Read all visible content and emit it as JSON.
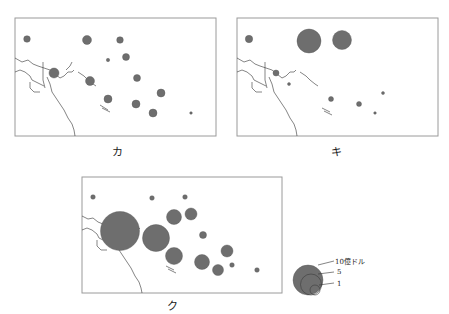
{
  "header": {
    "corner_text": ""
  },
  "maps": [
    {
      "id": "ka",
      "label": "カ",
      "frame": {
        "x": 15,
        "y": 18,
        "w": 201,
        "h": 118
      },
      "label_pos": {
        "x": 117,
        "y": 156
      },
      "bubbles": [
        {
          "cx": 27,
          "cy": 39,
          "r": 3.3
        },
        {
          "cx": 87,
          "cy": 40,
          "r": 4.5
        },
        {
          "cx": 120,
          "cy": 40,
          "r": 3.3
        },
        {
          "cx": 126,
          "cy": 57,
          "r": 3.5
        },
        {
          "cx": 108,
          "cy": 60,
          "r": 1.7
        },
        {
          "cx": 54,
          "cy": 73,
          "r": 5
        },
        {
          "cx": 90,
          "cy": 81,
          "r": 4.5
        },
        {
          "cx": 137,
          "cy": 78,
          "r": 3.5
        },
        {
          "cx": 161,
          "cy": 93,
          "r": 4
        },
        {
          "cx": 108,
          "cy": 99,
          "r": 4
        },
        {
          "cx": 136,
          "cy": 104,
          "r": 4
        },
        {
          "cx": 153,
          "cy": 113,
          "r": 4
        },
        {
          "cx": 191,
          "cy": 113,
          "r": 1.3
        }
      ]
    },
    {
      "id": "ki",
      "label": "キ",
      "frame": {
        "x": 237,
        "y": 18,
        "w": 201,
        "h": 118
      },
      "label_pos": {
        "x": 336,
        "y": 156
      },
      "bubbles": [
        {
          "cx": 249,
          "cy": 39,
          "r": 3.7
        },
        {
          "cx": 309,
          "cy": 41,
          "r": 12
        },
        {
          "cx": 342,
          "cy": 40,
          "r": 9.5
        },
        {
          "cx": 276,
          "cy": 73,
          "r": 3
        },
        {
          "cx": 289,
          "cy": 84,
          "r": 1.5
        },
        {
          "cx": 331,
          "cy": 99,
          "r": 2.5
        },
        {
          "cx": 359,
          "cy": 104,
          "r": 2.5
        },
        {
          "cx": 383,
          "cy": 93,
          "r": 1.5
        },
        {
          "cx": 375,
          "cy": 113,
          "r": 1.3
        }
      ]
    },
    {
      "id": "ku",
      "label": "ク",
      "frame": {
        "x": 82,
        "y": 177,
        "w": 200,
        "h": 116
      },
      "label_pos": {
        "x": 172,
        "y": 310
      },
      "bubbles": [
        {
          "cx": 93,
          "cy": 197,
          "r": 2.3
        },
        {
          "cx": 152,
          "cy": 198,
          "r": 2.3
        },
        {
          "cx": 185,
          "cy": 197,
          "r": 2.3
        },
        {
          "cx": 120,
          "cy": 231,
          "r": 19.5
        },
        {
          "cx": 156,
          "cy": 238,
          "r": 13.5
        },
        {
          "cx": 174,
          "cy": 217,
          "r": 7.5
        },
        {
          "cx": 191,
          "cy": 214,
          "r": 6
        },
        {
          "cx": 174,
          "cy": 256,
          "r": 8.5
        },
        {
          "cx": 203,
          "cy": 235,
          "r": 3.5
        },
        {
          "cx": 227,
          "cy": 251,
          "r": 6
        },
        {
          "cx": 202,
          "cy": 262,
          "r": 7.5
        },
        {
          "cx": 218,
          "cy": 270,
          "r": 5.5
        },
        {
          "cx": 232,
          "cy": 265,
          "r": 2.3
        },
        {
          "cx": 257,
          "cy": 270,
          "r": 2.3
        }
      ]
    }
  ],
  "legend": {
    "items": [
      {
        "label": "10億ドル",
        "r": 15
      },
      {
        "label": "5",
        "r": 10.5
      },
      {
        "label": "1",
        "r": 5
      }
    ],
    "unit": "億ドル"
  },
  "colors": {
    "bubble": "#6e6e6e",
    "frame": "#9a9a9a",
    "coast": "#333333"
  }
}
